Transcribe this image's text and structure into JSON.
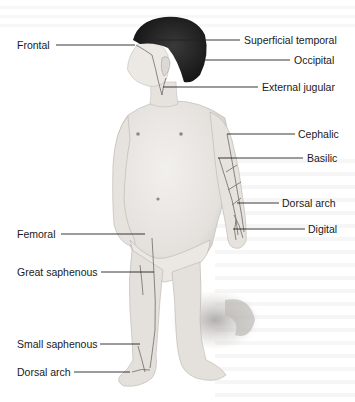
{
  "figure": {
    "colors": {
      "skin": "#e9e6e2",
      "skin_shadow": "#c9c5c0",
      "hair": "#1e1e1e",
      "vein": "#6e6a66",
      "leader_line": "#222222",
      "text": "#1a1a1a",
      "floor_shadow": "#b5b2ae"
    }
  },
  "labels_left": [
    {
      "id": "frontal",
      "text": "Frontal"
    },
    {
      "id": "femoral",
      "text": "Femoral"
    },
    {
      "id": "great-saphenous",
      "text": "Great saphenous"
    },
    {
      "id": "small-saphenous",
      "text": "Small saphenous"
    },
    {
      "id": "dorsal-arch-foot",
      "text": "Dorsal arch"
    }
  ],
  "labels_right": [
    {
      "id": "superficial-temporal",
      "text": "Superficial temporal"
    },
    {
      "id": "occipital",
      "text": "Occipital"
    },
    {
      "id": "external-jugular",
      "text": "External jugular"
    },
    {
      "id": "cephalic",
      "text": "Cephalic"
    },
    {
      "id": "basilic",
      "text": "Basilic"
    },
    {
      "id": "dorsal-arch-hand",
      "text": "Dorsal arch"
    },
    {
      "id": "digital",
      "text": "Digital"
    }
  ]
}
